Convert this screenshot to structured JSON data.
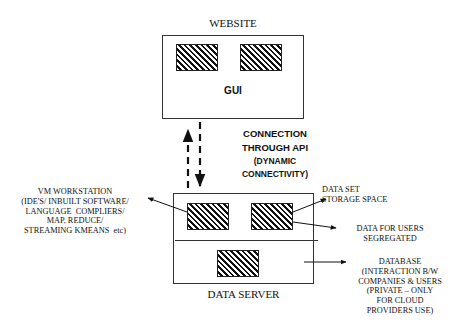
{
  "diagram": {
    "website": {
      "title": "WEBSITE",
      "inner_label": "GUI",
      "modules": 2
    },
    "connection": {
      "label_line1": "CONNECTION",
      "label_line2": "THROUGH API",
      "label_line3": "(DYNAMIC",
      "label_line4": "CONNECTIVITY)"
    },
    "data_server": {
      "title": "DATA SERVER",
      "modules": 3
    },
    "annotations": {
      "vm_workstation": "VM WORKSTATION\n(IDE'S/ INBUILT SOFTWARE/\nLANGUAGE  COMPLIERS/\nMAP, REDUCE/\nSTREAMING KMEANS  etc)",
      "data_set": "DATA SET\nSTORAGE SPACE",
      "data_for_users": "DATA FOR USERS\nSEGREGATED",
      "database": "DATABASE\n(INTERACTION B/W\nCOMPANIES & USERS\n(PRIVATE – ONLY\nFOR CLOUD\nPROVIDERS USE)"
    },
    "colors": {
      "stroke": "#222222",
      "background": "#ffffff"
    }
  }
}
